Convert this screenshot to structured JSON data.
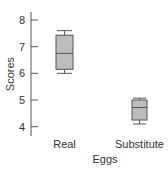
{
  "chart_data": {
    "type": "box",
    "title": "",
    "xlabel": "Eggs",
    "ylabel": "Scores",
    "ylim": [
      3.7,
      8.4
    ],
    "yticks": [
      4,
      5,
      6,
      7,
      8
    ],
    "grid": false,
    "legend": null,
    "categories": [
      "Real",
      "Substitute"
    ],
    "series": [
      {
        "name": "Real",
        "min": 6.0,
        "q1": 6.15,
        "median": 6.75,
        "q3": 7.43,
        "max": 7.6
      },
      {
        "name": "Substitute",
        "min": 4.1,
        "q1": 4.25,
        "median": 4.72,
        "q3": 5.0,
        "max": 5.07
      }
    ],
    "colors": {
      "box_fill": "#bdbdbd",
      "line": "#555555",
      "axis": "#555555"
    }
  }
}
